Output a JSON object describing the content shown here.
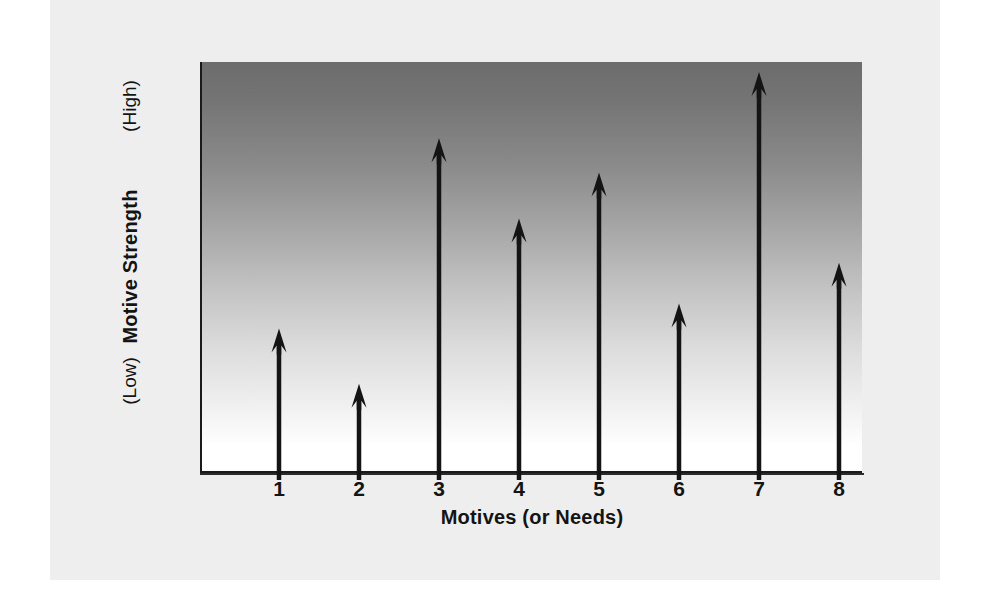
{
  "chart_data": {
    "type": "bar",
    "title": "",
    "subtitle": "",
    "xlabel": "Motives (or Needs)",
    "ylabel": "Motive Strength",
    "categories": [
      "1",
      "2",
      "3",
      "4",
      "5",
      "6",
      "7",
      "8"
    ],
    "values": [
      0.353,
      0.219,
      0.815,
      0.62,
      0.732,
      0.414,
      0.976,
      0.513
    ],
    "ylim": [
      0,
      1
    ],
    "y_tick_labels": [
      "(Low)",
      "(High)"
    ],
    "y_axis_note_low": "(Low)",
    "y_axis_note_high": "(High)",
    "grid": false,
    "legend": false,
    "legend_position": "none",
    "marker_style": "upward-arrow",
    "annotations": [],
    "axis_description": "Vertical arrows of varying height represent the relative strength of eight different motives; background shades from dark grey at high strength to white at low strength."
  },
  "figure": {
    "background_color": "#eeeeee",
    "page_color": "#ffffff",
    "plot_gradient_top": "#6c6c6c",
    "plot_gradient_bottom": "#ffffff",
    "axis_color": "#1a1a1a",
    "arrow_color": "#141414"
  },
  "axis": {
    "x_title": "Motives (or Needs)",
    "y_title": "Motive Strength",
    "y_top_label": "(High)",
    "y_bottom_label": "(Low)",
    "x_tick_labels": [
      "1",
      "2",
      "3",
      "4",
      "5",
      "6",
      "7",
      "8"
    ]
  }
}
